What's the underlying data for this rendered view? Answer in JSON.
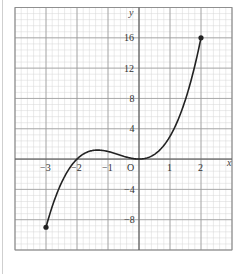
{
  "chart_data": {
    "type": "line",
    "title": "",
    "xlabel": "x",
    "ylabel": "y",
    "xlim": [
      -4,
      3
    ],
    "ylim": [
      -12,
      20
    ],
    "grid": true,
    "minor_grid": true,
    "x_ticks": [
      -3,
      -2,
      -1,
      1,
      2
    ],
    "x_tick_labels": [
      "−3",
      "−2",
      "−1",
      "1",
      "2"
    ],
    "y_ticks": [
      -8,
      -4,
      4,
      8,
      12,
      16
    ],
    "y_tick_labels": [
      "−8",
      "−4",
      "4",
      "8",
      "12",
      "16"
    ],
    "origin_label": "O",
    "series": [
      {
        "name": "y = x³ + 2x²",
        "x": [
          -3,
          -2.5,
          -2,
          -1.5,
          -1.333,
          -1,
          -0.5,
          0,
          0.5,
          1,
          1.5,
          2
        ],
        "y": [
          -9,
          -3.125,
          0,
          1.125,
          1.185,
          1,
          0.375,
          0,
          0.625,
          3,
          7.875,
          16
        ],
        "endpoints": [
          [
            -3,
            -9
          ],
          [
            2,
            16
          ]
        ],
        "color": "#222222"
      }
    ]
  },
  "labels": {
    "x_axis": "x",
    "y_axis": "y",
    "origin": "O"
  }
}
